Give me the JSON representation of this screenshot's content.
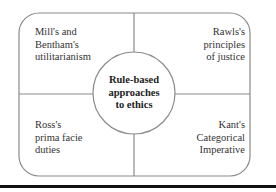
{
  "diagram": {
    "center": {
      "lines": [
        "Rule-based",
        "approaches",
        "to ethics"
      ]
    },
    "quadrants": [
      {
        "position": "top-left",
        "lines": [
          "Mill's and",
          "Bentham's",
          "utilitarianism"
        ]
      },
      {
        "position": "top-right",
        "lines": [
          "Rawls's",
          "principles",
          "of justice"
        ]
      },
      {
        "position": "bottom-left",
        "lines": [
          "Ross's",
          "prima facie",
          "duties"
        ]
      },
      {
        "position": "bottom-right",
        "lines": [
          "Kant's",
          "Categorical",
          "Imperative"
        ]
      }
    ]
  },
  "colors": {
    "outline": "#8a8a8a",
    "text": "#333333",
    "bottom_rule": "#111111"
  }
}
